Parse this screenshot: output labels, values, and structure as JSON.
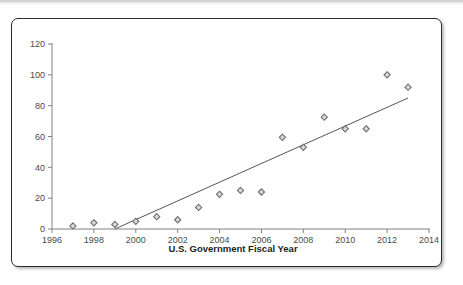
{
  "figure": {
    "frame_border_color": "#2b2b2b",
    "background_color": "#ffffff"
  },
  "chart_data": {
    "type": "scatter",
    "title": "",
    "subtitle": "",
    "xlabel": "U.S. Government Fiscal Year",
    "ylabel": "",
    "xlim": [
      1996,
      2014
    ],
    "ylim": [
      0,
      120
    ],
    "xticks": [
      1996,
      1998,
      2000,
      2002,
      2004,
      2006,
      2008,
      2010,
      2012,
      2014
    ],
    "yticks": [
      0,
      20,
      40,
      60,
      80,
      100,
      120
    ],
    "xtick_labels": [
      "1996",
      "1998",
      "2000",
      "2002",
      "2004",
      "2006",
      "2008",
      "2010",
      "2012",
      "2014"
    ],
    "ytick_labels": [
      "0",
      "20",
      "40",
      "60",
      "80",
      "100",
      "120"
    ],
    "grid": false,
    "legend": false,
    "legend_position": "none",
    "marker": "diamond",
    "marker_color": "#6e6e6e",
    "marker_fill": "#d9d9d9",
    "axis_color": "#808080",
    "series": [
      {
        "name": "observations",
        "x": [
          1997,
          1998,
          1999,
          2000,
          2001,
          2002,
          2003,
          2004,
          2005,
          2006,
          2007,
          2008,
          2009,
          2010,
          2011,
          2012,
          2013
        ],
        "values": [
          2,
          4,
          3,
          5,
          8,
          6,
          14,
          22.5,
          25,
          24,
          59.5,
          53,
          72.5,
          65,
          65,
          100,
          92
        ]
      }
    ],
    "trendline": {
      "name": "linear-fit",
      "color": "#555555",
      "x": [
        1999,
        2013
      ],
      "values": [
        0,
        85
      ]
    },
    "annotations": []
  }
}
